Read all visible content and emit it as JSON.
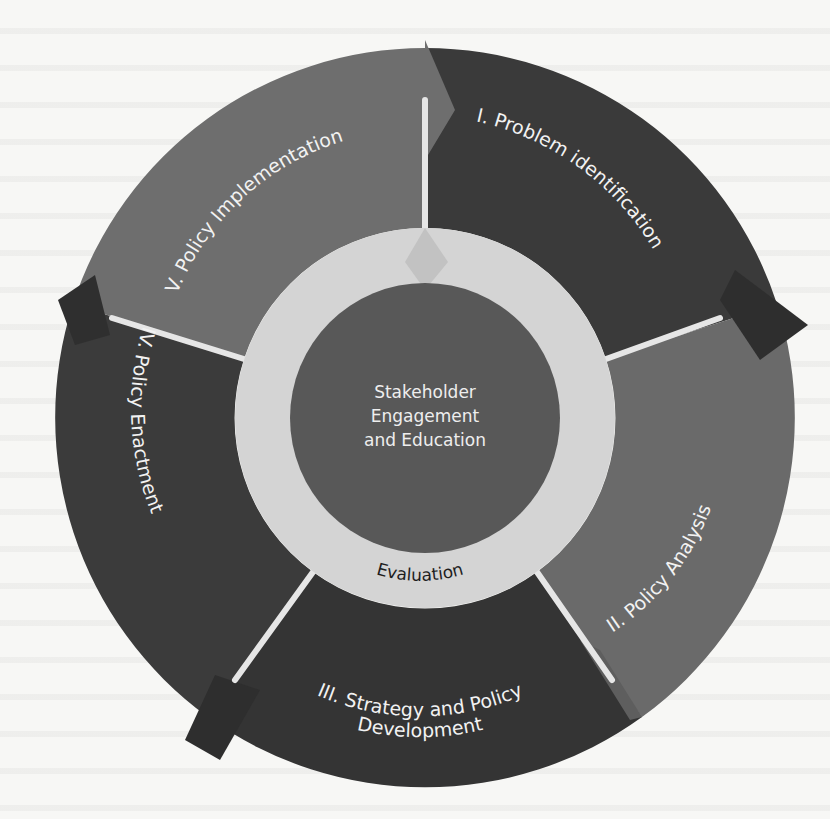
{
  "diagram": {
    "type": "cycle",
    "center": {
      "label_lines": [
        "Stakeholder",
        "Engagement",
        "and Education"
      ]
    },
    "inner_ring": {
      "label": "Evaluation"
    },
    "segments": [
      {
        "id": "I",
        "label": "I. Problem identification",
        "color": "#3a3a3a"
      },
      {
        "id": "II",
        "label": "II. Policy Analysis",
        "color": "#6a6a6a"
      },
      {
        "id": "III",
        "label_lines": [
          "III. Strategy and Policy",
          "Development"
        ],
        "color": "#343434"
      },
      {
        "id": "IV",
        "label": "IV. Policy Enactment",
        "color": "#3b3b3b"
      },
      {
        "id": "V",
        "label": "V. Policy Implementation",
        "color": "#6e6e6e"
      }
    ],
    "colors": {
      "ring": "#d4d4d4",
      "center_disk": "#585858",
      "divider": "#e6e6e6",
      "background": "#f7f7f5"
    }
  }
}
